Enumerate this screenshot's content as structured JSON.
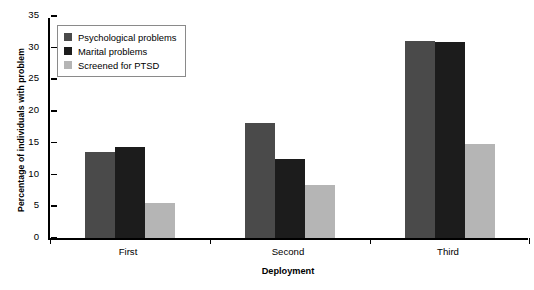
{
  "chart_data": {
    "type": "bar",
    "title": "",
    "xlabel": "Deployment",
    "ylabel": "Percentage of individuals with problem",
    "categories": [
      "First",
      "Second",
      "Third"
    ],
    "series": [
      {
        "name": "Psychological problems",
        "color": "#4a4a4a",
        "values": [
          13.5,
          18.1,
          31.1
        ]
      },
      {
        "name": "Marital problems",
        "color": "#1c1c1c",
        "values": [
          14.3,
          12.5,
          30.9
        ]
      },
      {
        "name": "Screened for PTSD",
        "color": "#b5b5b5",
        "values": [
          5.5,
          8.4,
          14.9
        ]
      }
    ],
    "ylim": [
      0,
      35
    ],
    "ytick_labels": [
      "0",
      "5",
      "10",
      "15",
      "20",
      "25",
      "30",
      "35"
    ],
    "ytick_values": [
      0,
      5,
      10,
      15,
      20,
      25,
      30,
      35
    ],
    "grid": false,
    "legend_position": "top-left"
  }
}
